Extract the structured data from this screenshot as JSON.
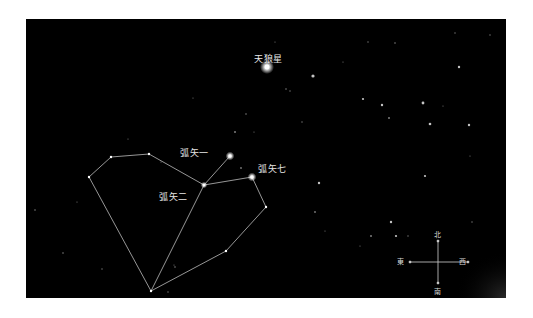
{
  "colors": {
    "sky": "#000000",
    "frame": "#ffffff",
    "lines": "#bdbdbd",
    "stars": "#ffffff",
    "labels": "#e8e8e8"
  },
  "star_labels": [
    {
      "text": "天狼星",
      "x": 254,
      "y": 54
    },
    {
      "text": "弧矢一",
      "x": 180,
      "y": 148
    },
    {
      "text": "弧矢七",
      "x": 258,
      "y": 164
    },
    {
      "text": "弧矢二",
      "x": 159,
      "y": 192
    }
  ],
  "compass": {
    "north": "北",
    "south": "南",
    "east": "東",
    "west": "西"
  },
  "constellation": {
    "vertices": [
      [
        89,
        177
      ],
      [
        111,
        157
      ],
      [
        149,
        154
      ],
      [
        204,
        185
      ],
      [
        230,
        156
      ],
      [
        252,
        177
      ],
      [
        266,
        207
      ],
      [
        226,
        251
      ],
      [
        151,
        291
      ]
    ],
    "edges": [
      [
        0,
        1
      ],
      [
        1,
        2
      ],
      [
        2,
        3
      ],
      [
        3,
        4
      ],
      [
        3,
        5
      ],
      [
        5,
        6
      ],
      [
        6,
        7
      ],
      [
        7,
        8
      ],
      [
        8,
        0
      ],
      [
        8,
        3
      ]
    ]
  },
  "bright_stars": [
    {
      "name": "天狼星",
      "x": 267,
      "y": 67,
      "r": 3.5
    },
    {
      "name": "弧矢一",
      "x": 230,
      "y": 156,
      "r": 2.2
    },
    {
      "name": "弧矢七",
      "x": 252,
      "y": 177,
      "r": 2.2
    },
    {
      "name": "弧矢二",
      "x": 204,
      "y": 185,
      "r": 1.6
    }
  ]
}
